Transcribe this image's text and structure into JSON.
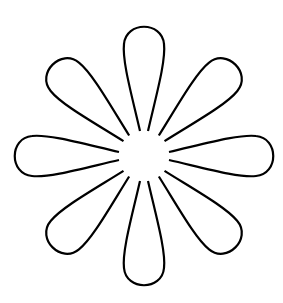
{
  "image": {
    "subject": "flower-outline",
    "petal_count": 8,
    "stroke_color": "#000000",
    "background_color": "#ffffff",
    "center": [
      144,
      156
    ],
    "petal_angles_deg": [
      0,
      45,
      90,
      135,
      180,
      225,
      270,
      315
    ]
  }
}
